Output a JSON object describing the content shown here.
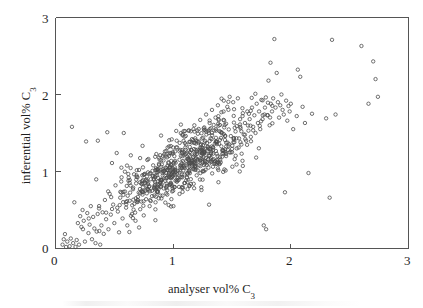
{
  "figure": {
    "background_color": "#ffffff",
    "axis_color": "#555555",
    "marker_color": "#4d4d4d"
  },
  "axes": {
    "x_title_text": "analyser vol% C",
    "x_title_sub": "3",
    "y_title_text": "inferential vol% C",
    "y_title_sub": "3",
    "x_ticks": [
      "0",
      "1",
      "2",
      "3"
    ],
    "y_ticks": [
      "0",
      "1",
      "2",
      "3"
    ]
  },
  "chart_data": {
    "type": "scatter",
    "title": "",
    "xlabel": "analyser vol% C3",
    "ylabel": "inferential vol% C3",
    "xlim": [
      0,
      3
    ],
    "ylim": [
      0,
      3
    ],
    "xticks": [
      0,
      1,
      2,
      3
    ],
    "yticks": [
      0,
      1,
      2,
      3
    ],
    "grid": false,
    "legend": null,
    "marker": "open-circle",
    "marker_size_px": 3.4,
    "n_points": 812,
    "points": [
      [
        0.06,
        0.05
      ],
      [
        0.07,
        0.12
      ],
      [
        0.09,
        0.02
      ],
      [
        0.1,
        0.09
      ],
      [
        0.12,
        0.03
      ],
      [
        0.13,
        0.13
      ],
      [
        0.14,
        1.58
      ],
      [
        0.15,
        0.07
      ],
      [
        0.16,
        0.6
      ],
      [
        0.17,
        0.02
      ],
      [
        0.18,
        0.11
      ],
      [
        0.19,
        0.33
      ],
      [
        0.2,
        0.05
      ],
      [
        0.21,
        0.42
      ],
      [
        0.22,
        0.28
      ],
      [
        0.23,
        0.5
      ],
      [
        0.24,
        0.36
      ],
      [
        0.25,
        0.09
      ],
      [
        0.26,
        1.39
      ],
      [
        0.27,
        0.46
      ],
      [
        0.28,
        0.2
      ],
      [
        0.29,
        0.31
      ],
      [
        0.3,
        0.55
      ],
      [
        0.31,
        0.12
      ],
      [
        0.32,
        0.41
      ],
      [
        0.33,
        0.26
      ],
      [
        0.34,
        0.07
      ],
      [
        0.35,
        0.22
      ],
      [
        0.36,
        1.4
      ],
      [
        0.37,
        0.52
      ],
      [
        0.38,
        0.05
      ],
      [
        0.39,
        0.3
      ],
      [
        0.4,
        0.47
      ],
      [
        0.41,
        0.19
      ],
      [
        0.42,
        0.63
      ],
      [
        0.43,
        0.38
      ],
      [
        0.44,
        1.51
      ],
      [
        0.45,
        0.25
      ],
      [
        0.46,
        0.71
      ],
      [
        0.47,
        0.44
      ],
      [
        0.48,
        1.11
      ],
      [
        0.49,
        0.57
      ],
      [
        0.5,
        0.33
      ],
      [
        0.51,
        0.82
      ],
      [
        0.52,
        1.24
      ],
      [
        0.53,
        0.48
      ],
      [
        0.54,
        0.21
      ],
      [
        0.55,
        0.66
      ],
      [
        0.56,
        1.05
      ],
      [
        0.57,
        0.39
      ],
      [
        0.58,
        1.5
      ],
      [
        0.59,
        0.74
      ],
      [
        0.6,
        0.53
      ],
      [
        0.61,
        0.3
      ],
      [
        0.62,
        0.88
      ],
      [
        0.63,
        0.62
      ],
      [
        0.64,
        1.21
      ],
      [
        0.65,
        0.45
      ],
      [
        0.66,
        0.79
      ],
      [
        0.67,
        0.58
      ],
      [
        0.68,
        0.36
      ],
      [
        0.69,
        0.93
      ],
      [
        0.7,
        0.67
      ],
      [
        0.71,
        1.02
      ],
      [
        0.72,
        0.51
      ],
      [
        0.73,
        0.84
      ],
      [
        0.74,
        0.7
      ],
      [
        0.75,
        0.43
      ],
      [
        0.76,
        0.97
      ],
      [
        0.77,
        0.64
      ],
      [
        0.78,
        1.15
      ],
      [
        0.79,
        0.76
      ],
      [
        0.8,
        0.55
      ],
      [
        0.81,
        0.9
      ],
      [
        0.82,
        0.68
      ],
      [
        0.83,
        1.08
      ],
      [
        0.84,
        0.8
      ],
      [
        0.85,
        0.6
      ],
      [
        0.86,
        0.99
      ],
      [
        0.87,
        0.73
      ],
      [
        0.88,
        1.18
      ],
      [
        0.89,
        0.85
      ],
      [
        0.9,
        0.65
      ],
      [
        0.91,
        1.03
      ],
      [
        0.92,
        0.78
      ],
      [
        0.93,
        1.26
      ],
      [
        0.94,
        0.91
      ],
      [
        0.95,
        0.7
      ],
      [
        0.96,
        1.12
      ],
      [
        0.97,
        0.83
      ],
      [
        0.98,
        1.33
      ],
      [
        0.99,
        0.96
      ],
      [
        1.0,
        0.75
      ],
      [
        1.01,
        1.2
      ],
      [
        1.02,
        0.88
      ],
      [
        1.03,
        1.4
      ],
      [
        1.04,
        1.01
      ],
      [
        1.05,
        0.8
      ],
      [
        1.06,
        1.28
      ],
      [
        1.07,
        0.93
      ],
      [
        1.08,
        1.47
      ],
      [
        1.09,
        1.06
      ],
      [
        1.1,
        0.85
      ],
      [
        1.11,
        1.35
      ],
      [
        1.12,
        0.98
      ],
      [
        1.13,
        1.53
      ],
      [
        1.14,
        1.11
      ],
      [
        1.15,
        0.9
      ],
      [
        1.16,
        1.42
      ],
      [
        1.17,
        1.03
      ],
      [
        1.18,
        1.6
      ],
      [
        1.19,
        1.16
      ],
      [
        1.2,
        0.95
      ],
      [
        1.21,
        1.49
      ],
      [
        1.22,
        1.08
      ],
      [
        1.23,
        1.67
      ],
      [
        1.24,
        1.21
      ],
      [
        1.25,
        1.0
      ],
      [
        1.26,
        1.56
      ],
      [
        1.27,
        1.13
      ],
      [
        1.28,
        1.74
      ],
      [
        1.29,
        1.26
      ],
      [
        1.3,
        1.05
      ],
      [
        1.31,
        1.63
      ],
      [
        1.32,
        1.18
      ],
      [
        1.33,
        1.8
      ],
      [
        1.34,
        1.31
      ],
      [
        1.35,
        1.1
      ],
      [
        1.36,
        1.7
      ],
      [
        1.37,
        1.23
      ],
      [
        1.38,
        1.86
      ],
      [
        1.39,
        1.36
      ],
      [
        1.4,
        1.15
      ],
      [
        1.41,
        1.77
      ],
      [
        1.42,
        1.28
      ],
      [
        1.43,
        1.92
      ],
      [
        1.44,
        1.41
      ],
      [
        1.45,
        1.2
      ],
      [
        1.46,
        1.84
      ],
      [
        1.47,
        1.33
      ],
      [
        1.48,
        1.97
      ],
      [
        1.49,
        1.46
      ],
      [
        1.5,
        1.25
      ],
      [
        1.51,
        1.9
      ],
      [
        1.52,
        1.38
      ],
      [
        1.53,
        1.52
      ],
      [
        1.54,
        1.3
      ],
      [
        1.55,
        1.95
      ],
      [
        1.56,
        1.43
      ],
      [
        1.57,
        1.58
      ],
      [
        1.58,
        1.35
      ],
      [
        1.59,
        1.72
      ],
      [
        1.6,
        1.48
      ],
      [
        1.61,
        1.63
      ],
      [
        1.62,
        1.4
      ],
      [
        1.63,
        1.78
      ],
      [
        1.64,
        1.53
      ],
      [
        1.65,
        1.68
      ],
      [
        1.66,
        1.45
      ],
      [
        1.67,
        1.83
      ],
      [
        1.68,
        1.58
      ],
      [
        1.69,
        1.73
      ],
      [
        1.7,
        1.5
      ],
      [
        1.71,
        1.88
      ],
      [
        1.72,
        1.63
      ],
      [
        1.73,
        1.78
      ],
      [
        1.74,
        1.55
      ],
      [
        1.75,
        1.93
      ],
      [
        1.76,
        1.68
      ],
      [
        1.77,
        0.3
      ],
      [
        1.78,
        1.83
      ],
      [
        1.79,
        0.25
      ],
      [
        1.8,
        1.73
      ],
      [
        1.81,
        2.18
      ],
      [
        1.82,
        1.6
      ],
      [
        1.83,
        1.88
      ],
      [
        1.84,
        1.78
      ],
      [
        1.85,
        1.95
      ],
      [
        1.86,
        2.72
      ],
      [
        1.87,
        1.83
      ],
      [
        1.88,
        2.28
      ],
      [
        1.89,
        1.9
      ],
      [
        1.9,
        1.7
      ],
      [
        1.91,
        1.86
      ],
      [
        1.92,
        2.0
      ],
      [
        1.93,
        1.8
      ],
      [
        1.94,
        1.74
      ],
      [
        1.95,
        0.73
      ],
      [
        1.96,
        1.92
      ],
      [
        1.97,
        1.66
      ],
      [
        1.98,
        1.85
      ],
      [
        1.99,
        1.78
      ],
      [
        2.0,
        1.88
      ],
      [
        2.02,
        1.55
      ],
      [
        2.05,
        1.72
      ],
      [
        2.08,
        2.23
      ],
      [
        2.1,
        1.84
      ],
      [
        2.12,
        1.63
      ],
      [
        2.15,
        0.98
      ],
      [
        2.18,
        1.75
      ],
      [
        2.3,
        1.69
      ],
      [
        2.33,
        0.66
      ],
      [
        2.35,
        2.71
      ],
      [
        2.38,
        1.74
      ],
      [
        2.6,
        2.63
      ],
      [
        2.66,
        1.88
      ],
      [
        2.7,
        2.43
      ],
      [
        2.72,
        2.2
      ],
      [
        2.74,
        1.97
      ]
    ]
  }
}
